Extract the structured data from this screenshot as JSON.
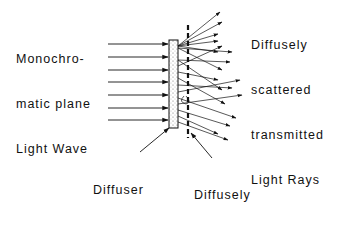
{
  "diagram": {
    "labels": {
      "incoming_wave": [
        "Monochro-",
        "matic plane",
        "Light Wave"
      ],
      "scattered_rays": [
        "Diffusely",
        "scattered",
        "transmitted",
        "Light Rays"
      ],
      "diffuser": [
        "Diffuser"
      ],
      "object": [
        "Diffusely",
        "illuminated",
        "object transparency"
      ]
    },
    "colors": {
      "ink": "#111111",
      "background": "#ffffff",
      "diffuser_fill": "#f2f2f2"
    }
  }
}
